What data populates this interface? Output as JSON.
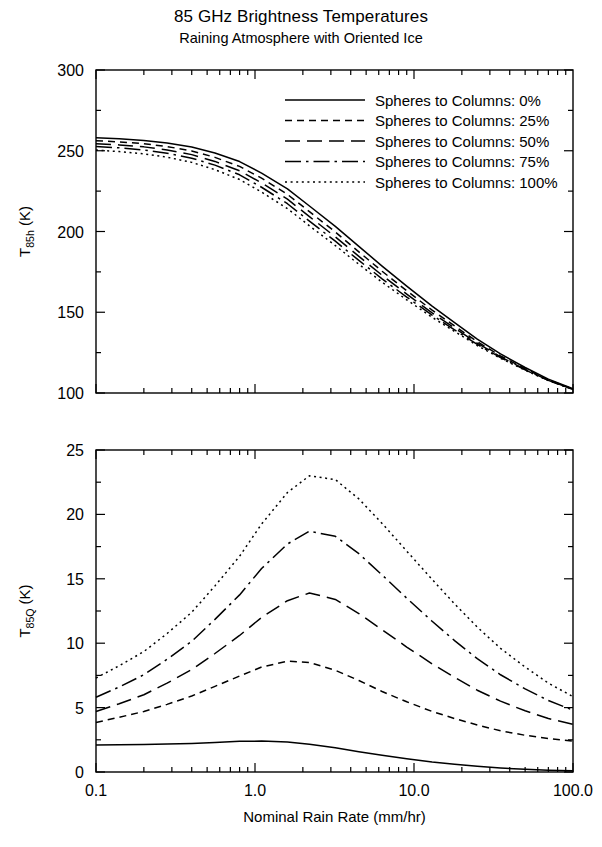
{
  "title": {
    "main": "85 GHz Brightness Temperatures",
    "sub": "Raining Atmosphere with Oriented Ice"
  },
  "legend": {
    "items": [
      {
        "label": "Spheres to Columns: 0%",
        "style": "solid"
      },
      {
        "label": "Spheres to Columns: 25%",
        "style": "short-dash"
      },
      {
        "label": "Spheres to Columns: 50%",
        "style": "long-dash"
      },
      {
        "label": "Spheres to Columns: 75%",
        "style": "dash-dot"
      },
      {
        "label": "Spheres to Columns: 100%",
        "style": "dotted"
      }
    ]
  },
  "axes": {
    "x": {
      "label": "Nominal Rain Rate (mm/hr)",
      "scale": "log",
      "min": 0.1,
      "max": 100,
      "ticklabels": [
        "0.1",
        "1.0",
        "10.0",
        "100.0"
      ],
      "tickvalues": [
        0.1,
        1,
        10,
        100
      ]
    },
    "y_top": {
      "label_base": "T",
      "label_sub": "85h",
      "label_unit": " (K)",
      "min": 100,
      "max": 300,
      "ticklabels": [
        "100",
        "150",
        "200",
        "250",
        "300"
      ],
      "tickvalues": [
        100,
        150,
        200,
        250,
        300
      ]
    },
    "y_bottom": {
      "label_base": "T",
      "label_sub": "85Q",
      "label_unit": " (K)",
      "min": 0,
      "max": 25,
      "ticklabels": [
        "0",
        "5",
        "10",
        "15",
        "20",
        "25"
      ],
      "tickvalues": [
        0,
        5,
        10,
        15,
        20,
        25
      ]
    }
  },
  "chart_data": [
    {
      "type": "line",
      "panel": "top",
      "title": "85 GHz Brightness Temperatures — Raining Atmosphere with Oriented Ice",
      "xlabel": "Nominal Rain Rate (mm/hr)",
      "ylabel": "T85h (K)",
      "xscale": "log",
      "xlim": [
        0.1,
        100
      ],
      "ylim": [
        100,
        300
      ],
      "grid": false,
      "legend_position": "upper-right-inside",
      "x": [
        0.1,
        0.14,
        0.2,
        0.28,
        0.4,
        0.56,
        0.8,
        1.1,
        1.6,
        2.2,
        3.2,
        4.5,
        6.3,
        9.0,
        13.0,
        18.0,
        25.0,
        35.0,
        50.0,
        70.0,
        100.0
      ],
      "series": [
        {
          "name": "Spheres to Columns: 0%",
          "style": "solid",
          "values": [
            258.0,
            257.4,
            256.4,
            254.8,
            252.3,
            248.6,
            243.3,
            236.2,
            226.4,
            215.8,
            203.2,
            190.8,
            178.6,
            166.2,
            153.8,
            143.6,
            133.4,
            124.2,
            115.8,
            108.6,
            102.6
          ]
        },
        {
          "name": "Spheres to Columns: 25%",
          "style": "short-dash",
          "values": [
            256.2,
            255.5,
            254.4,
            252.6,
            249.9,
            245.9,
            240.3,
            233.0,
            223.0,
            212.3,
            199.7,
            187.4,
            175.4,
            163.3,
            151.3,
            141.5,
            131.8,
            123.0,
            115.0,
            108.1,
            102.4
          ]
        },
        {
          "name": "Spheres to Columns: 50%",
          "style": "long-dash",
          "values": [
            254.4,
            253.6,
            252.4,
            250.5,
            247.6,
            243.4,
            237.6,
            230.1,
            220.0,
            209.2,
            196.7,
            184.6,
            172.9,
            161.2,
            149.6,
            140.2,
            130.9,
            122.4,
            114.6,
            107.9,
            102.3
          ]
        },
        {
          "name": "Spheres to Columns: 75%",
          "style": "dash-dot",
          "values": [
            252.6,
            251.8,
            250.5,
            248.5,
            245.4,
            241.1,
            235.1,
            227.4,
            217.2,
            206.4,
            194.0,
            182.1,
            170.7,
            159.4,
            148.2,
            139.1,
            130.1,
            121.9,
            114.3,
            107.8,
            102.2
          ]
        },
        {
          "name": "Spheres to Columns: 100%",
          "style": "dotted",
          "values": [
            250.4,
            249.5,
            248.1,
            246.0,
            242.8,
            238.3,
            232.2,
            224.4,
            214.2,
            203.5,
            191.3,
            179.7,
            168.6,
            157.7,
            146.9,
            138.1,
            129.4,
            121.5,
            114.1,
            107.7,
            102.2
          ]
        }
      ]
    },
    {
      "type": "line",
      "panel": "bottom",
      "xlabel": "Nominal Rain Rate (mm/hr)",
      "ylabel": "T85Q (K)",
      "xscale": "log",
      "xlim": [
        0.1,
        100
      ],
      "ylim": [
        0,
        25
      ],
      "grid": false,
      "x": [
        0.1,
        0.14,
        0.2,
        0.28,
        0.4,
        0.56,
        0.8,
        1.1,
        1.6,
        2.2,
        3.2,
        4.5,
        6.3,
        9.0,
        13.0,
        18.0,
        25.0,
        35.0,
        50.0,
        70.0,
        100.0
      ],
      "series": [
        {
          "name": "Spheres to Columns: 0%",
          "style": "solid",
          "values": [
            2.1,
            2.12,
            2.14,
            2.17,
            2.22,
            2.29,
            2.38,
            2.4,
            2.33,
            2.15,
            1.88,
            1.58,
            1.3,
            1.03,
            0.78,
            0.6,
            0.44,
            0.31,
            0.21,
            0.14,
            0.09
          ]
        },
        {
          "name": "Spheres to Columns: 25%",
          "style": "short-dash",
          "values": [
            3.85,
            4.25,
            4.7,
            5.25,
            5.9,
            6.65,
            7.45,
            8.15,
            8.6,
            8.5,
            7.9,
            7.1,
            6.25,
            5.45,
            4.7,
            4.15,
            3.65,
            3.2,
            2.85,
            2.6,
            2.4
          ]
        },
        {
          "name": "Spheres to Columns: 50%",
          "style": "long-dash",
          "values": [
            4.7,
            5.3,
            6.0,
            6.9,
            7.95,
            9.2,
            10.6,
            12.0,
            13.3,
            13.9,
            13.4,
            12.3,
            11.05,
            9.7,
            8.4,
            7.35,
            6.35,
            5.5,
            4.75,
            4.15,
            3.7
          ]
        },
        {
          "name": "Spheres to Columns: 75%",
          "style": "dash-dot",
          "values": [
            5.8,
            6.6,
            7.55,
            8.75,
            10.15,
            11.85,
            13.75,
            15.8,
            17.7,
            18.7,
            18.3,
            16.95,
            15.3,
            13.5,
            11.7,
            10.2,
            8.8,
            7.55,
            6.45,
            5.55,
            4.8
          ]
        },
        {
          "name": "Spheres to Columns: 100%",
          "style": "dotted",
          "values": [
            7.3,
            8.25,
            9.35,
            10.75,
            12.4,
            14.45,
            16.75,
            19.25,
            21.7,
            23.0,
            22.7,
            21.2,
            19.3,
            17.15,
            14.95,
            13.05,
            11.25,
            9.6,
            8.15,
            6.9,
            5.85
          ]
        }
      ]
    }
  ]
}
